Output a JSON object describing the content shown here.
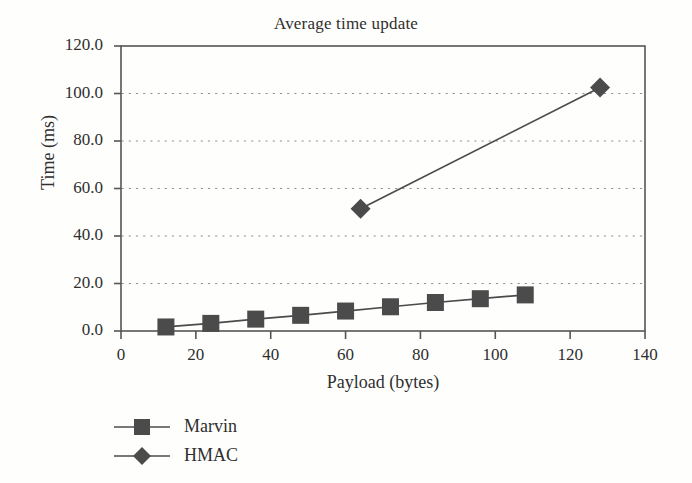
{
  "chart_data": {
    "type": "line",
    "title": "Average time update",
    "xlabel": "Payload (bytes)",
    "ylabel": "Time (ms)",
    "xlim": [
      0,
      140
    ],
    "ylim": [
      0,
      120
    ],
    "xticks": [
      "0",
      "20",
      "40",
      "60",
      "80",
      "100",
      "120",
      "140"
    ],
    "xtick_values": [
      0,
      20,
      40,
      60,
      80,
      100,
      120,
      140
    ],
    "yticks": [
      "0.0",
      "20.0",
      "40.0",
      "60.0",
      "80.0",
      "100.0",
      "120.0"
    ],
    "ytick_values": [
      0,
      20,
      40,
      60,
      80,
      100,
      120
    ],
    "grid": "horizontal-dotted",
    "legend_position": "below-left",
    "series": [
      {
        "name": "Marvin",
        "marker": "square",
        "color": "#4b4b4b",
        "x": [
          12,
          24,
          36,
          48,
          60,
          72,
          84,
          96,
          108
        ],
        "y": [
          1.7,
          3.2,
          5.0,
          6.6,
          8.4,
          10.2,
          12.0,
          13.6,
          15.2
        ]
      },
      {
        "name": "HMAC",
        "marker": "diamond",
        "color": "#4b4b4b",
        "x": [
          64,
          128
        ],
        "y": [
          51.5,
          102.5
        ]
      }
    ]
  },
  "legend": {
    "items": [
      {
        "label": "Marvin",
        "marker": "square"
      },
      {
        "label": "HMAC",
        "marker": "diamond"
      }
    ]
  },
  "colors": {
    "line": "#4b4b4b",
    "axis": "#555555",
    "grid": "#8e8e8e",
    "text": "#2f2f2f",
    "background": "#fefefd"
  }
}
